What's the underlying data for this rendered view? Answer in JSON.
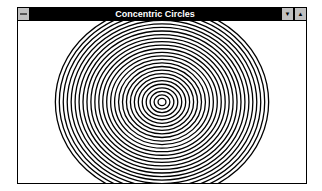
{
  "window": {
    "title": "Concentric Circles",
    "buttons": {
      "system_menu_icon": "system-menu-icon",
      "minimize_glyph": "▼",
      "maximize_glyph": "▲"
    }
  },
  "drawing": {
    "shape": "concentric-circles",
    "ring_count": 27,
    "stroke_color": "#000000",
    "background_color": "#ffffff"
  }
}
